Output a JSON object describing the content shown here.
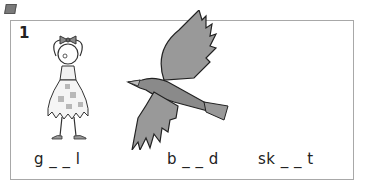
{
  "marker": {
    "icon": "square-bullet-icon"
  },
  "exercise": {
    "number": "1",
    "items": [
      {
        "picture": "girl",
        "word": "g _ _ l"
      },
      {
        "picture": "bird",
        "word": "b _ _ d"
      },
      {
        "picture": "",
        "word": "sk _ _ t"
      }
    ]
  }
}
